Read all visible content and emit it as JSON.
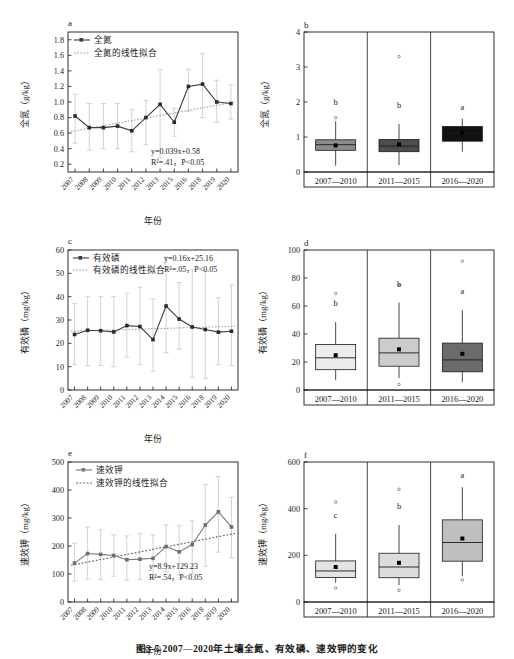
{
  "figure": {
    "caption": "图3-5  2007—2020年土壤全氮、有效磷、速效钾的变化",
    "axis_label_x": "年份",
    "panel_ids": {
      "a": "a",
      "b": "b",
      "c": "c",
      "d": "d",
      "e": "e",
      "f": "f"
    }
  },
  "chart_data": [
    {
      "id": "a",
      "type": "line",
      "title": "a",
      "xlabel": "年份",
      "ylabel": "全氮（g/kg）",
      "ylim": [
        0.1,
        1.9
      ],
      "yticks": [
        "0.2",
        "0.4",
        "0.6",
        "0.8",
        "1.0",
        "1.2",
        "1.4",
        "1.6",
        "1.8"
      ],
      "ytick_values": [
        0.2,
        0.4,
        0.6,
        0.8,
        1.0,
        1.2,
        1.4,
        1.6,
        1.8
      ],
      "grid": false,
      "legend_position": "top-left",
      "legend": [
        "全氮",
        "全氮的线性拟合"
      ],
      "categories": [
        "2007",
        "2008",
        "2009",
        "2010",
        "2011",
        "2012",
        "2013",
        "2015",
        "2016",
        "2018",
        "2019",
        "2020"
      ],
      "values": [
        0.82,
        0.67,
        0.67,
        0.69,
        0.63,
        0.8,
        0.97,
        0.74,
        1.2,
        1.23,
        1.0,
        0.98
      ],
      "error_low": [
        0.47,
        0.38,
        0.4,
        0.4,
        0.36,
        0.45,
        0.28,
        0.56,
        0.88,
        0.8,
        0.74,
        0.78
      ],
      "error_high": [
        1.1,
        0.98,
        0.98,
        0.98,
        0.9,
        1.02,
        1.42,
        0.92,
        1.42,
        1.62,
        1.28,
        1.22
      ],
      "fit": {
        "equation": "y=0.039x+0.58",
        "r2": "R²=.41",
        "p": "P<0.05",
        "y_start": 0.62,
        "y_end": 1.0
      }
    },
    {
      "id": "b",
      "type": "box",
      "title": "b",
      "ylabel": "全氮（g/kg）",
      "ylim": [
        0,
        4
      ],
      "yticks": [
        "0",
        "1",
        "2",
        "3",
        "4"
      ],
      "ytick_values": [
        0,
        1,
        2,
        3,
        4
      ],
      "categories": [
        "2007—2010",
        "2011—2015",
        "2016—2020"
      ],
      "significance": [
        "b",
        "b",
        "a"
      ],
      "boxes": [
        {
          "q1": 0.62,
          "median": 0.78,
          "q3": 0.92,
          "whisker_low": 0.18,
          "whisker_high": 1.45,
          "mean": 0.76,
          "outliers": [
            1.55
          ],
          "fill": "#8c8c8c"
        },
        {
          "q1": 0.58,
          "median": 0.74,
          "q3": 0.93,
          "whisker_low": 0.2,
          "whisker_high": 1.37,
          "mean": 0.79,
          "outliers": [
            3.3
          ],
          "fill": "#4d4d4d"
        },
        {
          "q1": 0.88,
          "median": 1.1,
          "q3": 1.3,
          "whisker_low": 0.58,
          "whisker_high": 1.52,
          "mean": 1.12,
          "outliers": [],
          "fill": "#111111"
        }
      ]
    },
    {
      "id": "c",
      "type": "line",
      "title": "c",
      "xlabel": "年份",
      "ylabel": "有效磷（mg/kg）",
      "ylim": [
        0,
        60
      ],
      "yticks": [
        "0",
        "10",
        "20",
        "30",
        "40",
        "50",
        "60"
      ],
      "ytick_values": [
        0,
        10,
        20,
        30,
        40,
        50,
        60
      ],
      "grid": false,
      "legend_position": "top-left",
      "legend": [
        "有效磷",
        "有效磷的线性拟合"
      ],
      "categories": [
        "2007",
        "2008",
        "2009",
        "2010",
        "2011",
        "2012",
        "2013",
        "2014",
        "2015",
        "2016",
        "2018",
        "2019",
        "2020"
      ],
      "values": [
        23.8,
        25.6,
        25.4,
        24.9,
        27.6,
        27.2,
        21.6,
        36.0,
        30.4,
        27.0,
        25.9,
        24.8,
        25.2
      ],
      "error_low": [
        11.0,
        10.5,
        10.5,
        10.0,
        14.0,
        11.0,
        8.0,
        16.0,
        17.5,
        5.5,
        5.0,
        10.8,
        10.5
      ],
      "error_high": [
        37.0,
        40.0,
        40.0,
        40.0,
        41.5,
        44.0,
        39.0,
        57.0,
        46.0,
        51.5,
        51.0,
        39.5,
        45.0
      ],
      "fit": {
        "equation": "y=0.16x+25.16",
        "r2": "R²=.05",
        "p": "P<0.05",
        "y_start": 25.2,
        "y_end": 27.3
      }
    },
    {
      "id": "d",
      "type": "box",
      "title": "d",
      "ylabel": "有效磷（mg/kg）",
      "ylim": [
        0,
        100
      ],
      "yticks": [
        "0",
        "20",
        "40",
        "60",
        "80",
        "100"
      ],
      "ytick_values": [
        0,
        20,
        40,
        60,
        80,
        100
      ],
      "categories": [
        "2007—2010",
        "2011—2015",
        "2016—2020"
      ],
      "significance": [
        "b",
        "b",
        "a"
      ],
      "boxes": [
        {
          "q1": 14.5,
          "median": 23.0,
          "q3": 32.5,
          "whisker_low": 7.0,
          "whisker_high": 48.5,
          "mean": 24.8,
          "outliers": [
            69.0
          ],
          "fill": "#ececec"
        },
        {
          "q1": 17.0,
          "median": 26.5,
          "q3": 37.0,
          "whisker_low": 8.5,
          "whisker_high": 62.5,
          "mean": 29.0,
          "outliers": [
            75.0,
            4.0
          ],
          "fill": "#cccccc"
        },
        {
          "q1": 13.0,
          "median": 21.5,
          "q3": 33.5,
          "whisker_low": 5.5,
          "whisker_high": 57.0,
          "mean": 25.8,
          "outliers": [
            92.0
          ],
          "fill": "#6b6b6b"
        }
      ]
    },
    {
      "id": "e",
      "type": "line",
      "title": "e",
      "xlabel": "年份",
      "ylabel": "速效钾（mg/kg）",
      "ylim": [
        0,
        500
      ],
      "yticks": [
        "0",
        "100",
        "200",
        "300",
        "400",
        "500"
      ],
      "ytick_values": [
        0,
        100,
        200,
        300,
        400,
        500
      ],
      "grid": false,
      "legend_position": "top-left",
      "legend": [
        "速效钾",
        "速效钾的线性拟合"
      ],
      "categories": [
        "2007",
        "2008",
        "2009",
        "2010",
        "2011",
        "2012",
        "2013",
        "2014",
        "2015",
        "2016",
        "2018",
        "2019",
        "2020"
      ],
      "values": [
        139,
        173,
        170,
        166,
        151,
        153,
        156,
        198,
        179,
        205,
        275,
        322,
        268
      ],
      "error_low": [
        75,
        82,
        80,
        92,
        78,
        80,
        86,
        108,
        96,
        100,
        128,
        178,
        158
      ],
      "error_high": [
        210,
        268,
        258,
        240,
        236,
        244,
        240,
        276,
        272,
        290,
        420,
        448,
        374
      ],
      "fit": {
        "equation": "y=8.9x+129.23",
        "r2": "R²=.54",
        "p": "P<0.05",
        "y_start": 131,
        "y_end": 245
      }
    },
    {
      "id": "f",
      "type": "box",
      "title": "f",
      "ylabel": "速效钾（mg/kg）",
      "ylim": [
        0,
        600
      ],
      "yticks": [
        "0",
        "200",
        "400",
        "600"
      ],
      "ytick_values": [
        0,
        200,
        400,
        600
      ],
      "categories": [
        "2007—2010",
        "2011—2015",
        "2016—2020"
      ],
      "significance": [
        "c",
        "b",
        "a"
      ],
      "boxes": [
        {
          "q1": 105,
          "median": 133,
          "q3": 176,
          "whisker_low": 82,
          "whisker_high": 292,
          "mean": 150,
          "outliers": [
            428,
            60
          ],
          "fill": "#e3e3e3"
        },
        {
          "q1": 104,
          "median": 150,
          "q3": 209,
          "whisker_low": 72,
          "whisker_high": 330,
          "mean": 168,
          "outliers": [
            483,
            50
          ],
          "fill": "#dcdcdc"
        },
        {
          "q1": 175,
          "median": 255,
          "q3": 352,
          "whisker_low": 110,
          "whisker_high": 492,
          "mean": 272,
          "outliers": [
            95
          ],
          "fill": "#bfbfbf"
        }
      ]
    }
  ],
  "colors": {
    "axis": "#1a1a1a",
    "series_line": "#3b3b3b",
    "error_bar": "#bdbdbd",
    "fit_line": "#9a9a9a",
    "text": "#1a1a1a"
  }
}
